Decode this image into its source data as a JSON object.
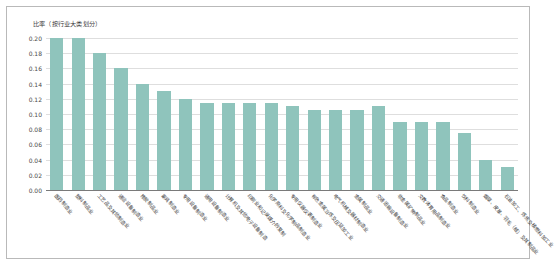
{
  "chart_data": {
    "type": "bar",
    "title": "比率（按行业大类划分）",
    "xlabel": "",
    "ylabel": "比率",
    "ylim": [
      0.0,
      0.2
    ],
    "ytick_step": 0.02,
    "yticks": [
      "0.20",
      "0.18",
      "0.16",
      "0.14",
      "0.12",
      "0.10",
      "0.08",
      "0.06",
      "0.04",
      "0.02",
      "0.00"
    ],
    "grid": true,
    "legend": "none",
    "bar_color": "#8fc4bc",
    "grid_color": "#dedede",
    "axis_color": "#7a7a7a",
    "categories": [
      "医药制造业",
      "塑料制品业",
      "工艺品及其他制造业",
      "通信设备制造业",
      "橡胶制品业",
      "家具制造业",
      "专用设备制造业",
      "通用设备制造业",
      "计算机及其他电子设备制造",
      "印刷业和记录媒介的复制",
      "化学原料及化学制品制造业",
      "专用仪器仪表制造业",
      "有色金属冶炼及压延加工业",
      "电气机械及器材制造业",
      "金属制品业",
      "交通运输设备制造业",
      "非金属矿物制品业",
      "文教体育用品制造业",
      "食品制造业",
      "饮料制造业",
      "烟草、皮革、羽毛（绒）及其制品业",
      "石油加工、炼焦及核燃料加工业"
    ],
    "values": [
      0.2,
      0.2,
      0.18,
      0.16,
      0.14,
      0.13,
      0.12,
      0.115,
      0.115,
      0.115,
      0.115,
      0.11,
      0.105,
      0.105,
      0.105,
      0.11,
      0.09,
      0.09,
      0.09,
      0.075,
      0.04,
      0.03
    ]
  }
}
